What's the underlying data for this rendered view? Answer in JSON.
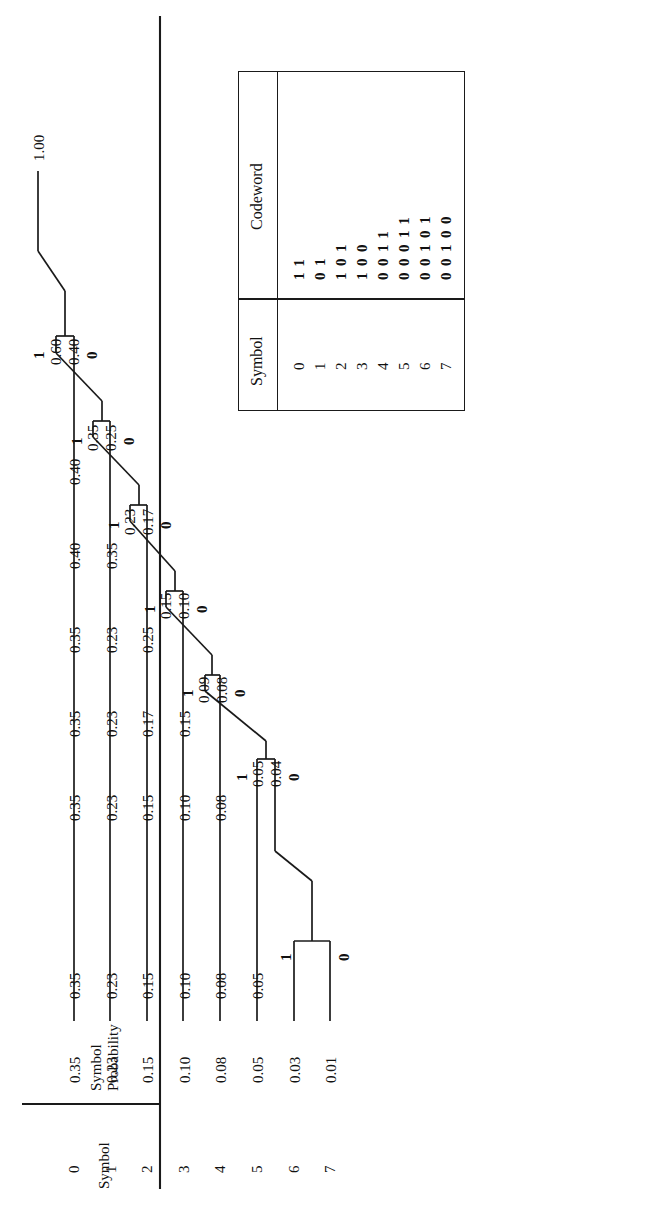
{
  "figure": {
    "type": "huffman-coding-tree",
    "columns": {
      "symbol_header": "Symbol",
      "probability_header_line1": "Symbol",
      "probability_header_line2": "Probability"
    },
    "symbols": [
      "0",
      "1",
      "2",
      "3",
      "4",
      "5",
      "6",
      "7"
    ],
    "probabilities": [
      "0.35",
      "0.23",
      "0.15",
      "0.10",
      "0.08",
      "0.05",
      "0.03",
      "0.01"
    ],
    "root_value": "1.00",
    "stages": [
      {
        "name": "stage1",
        "values": [
          "0.35",
          "0.23",
          "0.15",
          "0.10",
          "0.08",
          "0.05",
          "0.04"
        ],
        "merge": {
          "one": "1",
          "zero": "0",
          "hi": "0.03",
          "lo": "0.01"
        }
      },
      {
        "name": "stage2",
        "values": [
          "0.35",
          "0.23",
          "0.15",
          "0.10",
          "0.08"
        ],
        "merge": {
          "one": "1",
          "zero": "0",
          "hi": "0.05",
          "lo": "0.04"
        }
      },
      {
        "name": "stage3",
        "values": [
          "0.35",
          "0.23",
          "0.17",
          "0.15",
          "0.10"
        ],
        "merge": {
          "one": "1",
          "zero": "0",
          "hi": "0.09",
          "lo": "0.08"
        }
      },
      {
        "name": "stage4",
        "values": [
          "0.35",
          "0.23",
          "0.25",
          "0.17"
        ],
        "merge": {
          "one": "1",
          "zero": "0",
          "hi": "0.15",
          "lo": "0.10"
        }
      },
      {
        "name": "stage5",
        "values": [
          "0.40",
          "0.35",
          "0.25"
        ],
        "merge": {
          "one": "1",
          "zero": "0",
          "hi": "0.23",
          "lo": "0.17"
        }
      },
      {
        "name": "stage6",
        "values": [
          "0.40",
          "0.60"
        ],
        "merge": {
          "one": "1",
          "zero": "0",
          "hi": "0.35",
          "lo": "0.25"
        }
      },
      {
        "name": "stage7",
        "values": [
          "1.00"
        ],
        "merge": {
          "one": "1",
          "zero": "0",
          "hi": "0.60",
          "lo": "0.40"
        }
      }
    ],
    "branch_labels": {
      "one": "1",
      "zero": "0"
    }
  },
  "codeword_table": {
    "headers": {
      "symbol": "Symbol",
      "codeword": "Codeword"
    },
    "rows": [
      {
        "symbol": "0",
        "codeword": "11"
      },
      {
        "symbol": "1",
        "codeword": "01"
      },
      {
        "symbol": "2",
        "codeword": "101"
      },
      {
        "symbol": "3",
        "codeword": "100"
      },
      {
        "symbol": "4",
        "codeword": "0011"
      },
      {
        "symbol": "5",
        "codeword": "00011"
      },
      {
        "symbol": "6",
        "codeword": "00101"
      },
      {
        "symbol": "7",
        "codeword": "00100"
      }
    ]
  },
  "colors": {
    "ink": "#1a1a1a",
    "background": "#ffffff"
  }
}
